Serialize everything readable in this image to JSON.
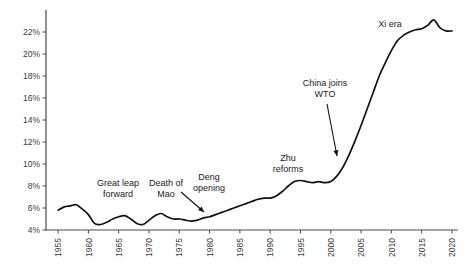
{
  "chart_data": {
    "type": "line",
    "title": "",
    "subtitle": "",
    "xlabel": "",
    "ylabel": "",
    "xlim": [
      1953,
      2021
    ],
    "ylim": [
      4,
      23.6
    ],
    "grid": false,
    "legend": "none",
    "x_ticks": [
      "1955",
      "1960",
      "1965",
      "1970",
      "1975",
      "1980",
      "1985",
      "1990",
      "1995",
      "2000",
      "2005",
      "2010",
      "2015",
      "2020"
    ],
    "x_tick_values": [
      1955,
      1960,
      1965,
      1970,
      1975,
      1980,
      1985,
      1990,
      1995,
      2000,
      2005,
      2010,
      2015,
      2020
    ],
    "y_ticks": [
      "4%",
      "6%",
      "8%",
      "10%",
      "12%",
      "14%",
      "16%",
      "18%",
      "20%",
      "22%"
    ],
    "y_tick_values": [
      4,
      6,
      8,
      10,
      12,
      14,
      16,
      18,
      20,
      22
    ],
    "series": [
      {
        "name": "China share",
        "x": [
          1955,
          1956,
          1957,
          1958,
          1959,
          1960,
          1961,
          1962,
          1963,
          1964,
          1965,
          1966,
          1967,
          1968,
          1969,
          1970,
          1971,
          1972,
          1973,
          1974,
          1975,
          1976,
          1977,
          1978,
          1979,
          1980,
          1981,
          1982,
          1983,
          1984,
          1985,
          1986,
          1987,
          1988,
          1989,
          1990,
          1991,
          1992,
          1993,
          1994,
          1995,
          1996,
          1997,
          1998,
          1999,
          2000,
          2001,
          2002,
          2003,
          2004,
          2005,
          2006,
          2007,
          2008,
          2009,
          2010,
          2011,
          2012,
          2013,
          2014,
          2015,
          2016,
          2017,
          2018,
          2019,
          2020
        ],
        "values": [
          5.8,
          6.1,
          6.2,
          6.3,
          5.9,
          5.4,
          4.6,
          4.5,
          4.7,
          5.0,
          5.2,
          5.3,
          5.0,
          4.6,
          4.5,
          4.9,
          5.3,
          5.5,
          5.2,
          5.0,
          5.0,
          4.9,
          4.8,
          4.9,
          5.1,
          5.2,
          5.4,
          5.6,
          5.8,
          6.0,
          6.2,
          6.4,
          6.6,
          6.8,
          6.9,
          6.9,
          7.1,
          7.5,
          8.0,
          8.4,
          8.5,
          8.4,
          8.3,
          8.4,
          8.3,
          8.4,
          8.9,
          9.7,
          10.8,
          12.1,
          13.5,
          15.0,
          16.5,
          18.0,
          19.2,
          20.3,
          21.2,
          21.7,
          22.0,
          22.2,
          22.3,
          22.6,
          23.1,
          22.4,
          22.1,
          22.1
        ]
      }
    ],
    "annotations": [
      {
        "text_line1": "Great leap",
        "text_line2": "forward",
        "name": "great-leap-forward-annotation",
        "x": 118,
        "y": 186,
        "arrow": false
      },
      {
        "text_line1": "Death of",
        "text_line2": "Mao",
        "name": "death-of-mao-annotation",
        "x": 166,
        "y": 186,
        "arrow": true
      },
      {
        "text_line1": "Deng",
        "text_line2": "opening",
        "name": "deng-opening-annotation",
        "x": 209,
        "y": 180,
        "arrow": false
      },
      {
        "text_line1": "Zhu",
        "text_line2": "reforms",
        "name": "zhu-reforms-annotation",
        "x": 288,
        "y": 161,
        "arrow": false
      },
      {
        "text_line1": "China joins",
        "text_line2": "WTO",
        "name": "china-joins-wto-annotation",
        "x": 325,
        "y": 86,
        "arrow": true
      },
      {
        "text_line1": "Xi era",
        "text_line2": "",
        "name": "xi-era-annotation",
        "x": 390,
        "y": 27,
        "arrow": false
      }
    ],
    "colors": {
      "line": "#111111",
      "axis": "#4a4a4a",
      "tick_text": "#3a3a3a",
      "annotation_text": "#1a1a1a",
      "background": "#ffffff"
    }
  }
}
